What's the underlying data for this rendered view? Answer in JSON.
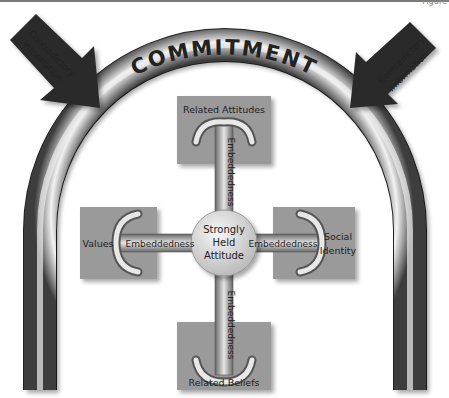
{
  "figure_label": "Figure",
  "arch": {
    "label": "COMMITMENT"
  },
  "arrows": [
    {
      "side": "left",
      "line1": "Contradictory",
      "line2": "information"
    },
    {
      "side": "right",
      "line1": "Contradictory",
      "line2": "information"
    }
  ],
  "center": {
    "line1": "Strongly",
    "line2": "Held",
    "line3": "Attitude"
  },
  "boxes": {
    "top": {
      "label": "Related Attitudes",
      "connector": "Embeddedness"
    },
    "left": {
      "label": "Values",
      "connector": "Embeddedness"
    },
    "right": {
      "line1": "Social",
      "line2": "Identity",
      "connector": "Embeddedness"
    },
    "bottom": {
      "label": "Related Beliefs",
      "connector": "Embeddedness"
    }
  },
  "colors": {
    "box_fill": "#9a9a9a",
    "arch_dark": "#3a3a3a",
    "arch_light": "#f2f2f2",
    "arrow_fill": "#2a2a2a",
    "circle_fill": "#dcdcdc"
  }
}
